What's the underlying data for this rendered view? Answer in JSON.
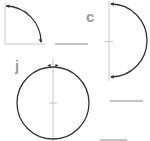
{
  "colors": {
    "arc": "#333333",
    "axis": "#c8c8c8",
    "blank": "#8a8a8a",
    "label": "#9a9a9a"
  },
  "figures": [
    {
      "id": "quarter-turn",
      "label": "",
      "type": "quarter-arc",
      "turn_fraction": "1/4"
    },
    {
      "id": "half-turn",
      "label": "c",
      "type": "half-arc",
      "turn_fraction": "1/2"
    },
    {
      "id": "full-turn",
      "label": "j",
      "type": "full-circle",
      "turn_fraction": "1"
    }
  ],
  "answer_blanks": [
    {
      "id": "blank-1",
      "value": ""
    },
    {
      "id": "blank-2",
      "value": ""
    },
    {
      "id": "blank-3",
      "value": ""
    }
  ]
}
